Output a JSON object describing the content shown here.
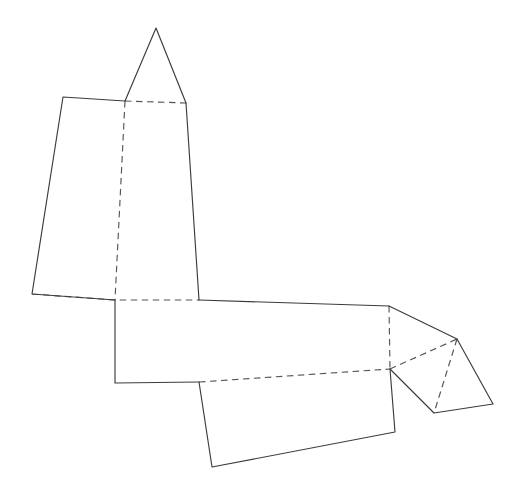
{
  "document": {
    "kind": "geometry-figure",
    "title": "Polyhedron net",
    "subject": "net-of-solid",
    "background_color": "#ffffff",
    "canvas": {
      "width": 525,
      "height": 498
    }
  },
  "style": {
    "solid_edge_color": "#3c3c40",
    "dashed_edge_color": "#55555a",
    "stroke_width": 1.15,
    "dash_pattern": "6.5 4.5"
  },
  "chart_data": {
    "type": "line",
    "xlabel": "",
    "ylabel": "",
    "xlim": [
      0,
      525
    ],
    "ylim": [
      498,
      0
    ],
    "grid": false,
    "legend": "none",
    "vertices": {
      "apex_top": [
        156,
        28
      ],
      "roof_base_left": [
        125,
        101
      ],
      "roof_base_right": [
        186,
        103
      ],
      "upper_left_top": [
        63,
        97
      ],
      "upper_left_bottom": [
        32,
        294
      ],
      "mid_left_top": [
        115,
        300
      ],
      "mid_left_bottom": [
        114,
        383
      ],
      "mid_right_top": [
        199,
        300
      ],
      "mid_right_bottom": [
        199,
        382
      ],
      "long_right_top": [
        389,
        306
      ],
      "long_right_bottom": [
        390,
        369
      ],
      "lower_panel_bottom_left": [
        212,
        467
      ],
      "lower_panel_bottom_right": [
        395,
        432
      ],
      "flap_apex_right": [
        457,
        339
      ],
      "flap_bottom_left": [
        434,
        413
      ],
      "flap_bottom_right": [
        493,
        404
      ]
    },
    "series": [
      {
        "name": "solid-edges",
        "style": "solid",
        "paths": [
          [
            [
              125,
              101
            ],
            [
              156,
              28
            ],
            [
              186,
              103
            ]
          ],
          [
            [
              125,
              101
            ],
            [
              63,
              97
            ],
            [
              32,
              294
            ],
            [
              115,
              300
            ]
          ],
          [
            [
              186,
              103
            ],
            [
              199,
              300
            ]
          ],
          [
            [
              115,
              300
            ],
            [
              115,
              383
            ],
            [
              199,
              382
            ]
          ],
          [
            [
              199,
              300
            ],
            [
              389,
              306
            ]
          ],
          [
            [
              389,
              306
            ],
            [
              457,
              339
            ]
          ],
          [
            [
              390,
              369
            ],
            [
              434,
              413
            ],
            [
              493,
              404
            ],
            [
              457,
              339
            ]
          ],
          [
            [
              390,
              369
            ],
            [
              395,
              432
            ],
            [
              212,
              467
            ],
            [
              199,
              382
            ]
          ]
        ]
      },
      {
        "name": "dashed-fold-lines",
        "style": "dashed",
        "paths": [
          [
            [
              125,
              101
            ],
            [
              186,
              103
            ]
          ],
          [
            [
              125,
              101
            ],
            [
              115,
              300
            ]
          ],
          [
            [
              32,
              294
            ],
            [
              115,
              300
            ],
            [
              199,
              300
            ]
          ],
          [
            [
              199,
              382
            ],
            [
              390,
              369
            ]
          ],
          [
            [
              389,
              306
            ],
            [
              390,
              369
            ]
          ],
          [
            [
              390,
              369
            ],
            [
              457,
              339
            ]
          ],
          [
            [
              457,
              339
            ],
            [
              434,
              413
            ]
          ]
        ]
      }
    ],
    "faces": [
      {
        "name": "roof-triangle",
        "points": [
          [
            125,
            101
          ],
          [
            156,
            28
          ],
          [
            186,
            103
          ]
        ]
      },
      {
        "name": "left-large-quad",
        "points": [
          [
            63,
            97
          ],
          [
            125,
            101
          ],
          [
            115,
            300
          ],
          [
            32,
            294
          ]
        ]
      },
      {
        "name": "right-upper-quad",
        "points": [
          [
            125,
            101
          ],
          [
            186,
            103
          ],
          [
            199,
            300
          ],
          [
            115,
            300
          ]
        ]
      },
      {
        "name": "center-square",
        "points": [
          [
            115,
            300
          ],
          [
            199,
            300
          ],
          [
            199,
            382
          ],
          [
            115,
            383
          ]
        ]
      },
      {
        "name": "long-horizontal-quad",
        "points": [
          [
            199,
            300
          ],
          [
            389,
            306
          ],
          [
            390,
            369
          ],
          [
            199,
            382
          ]
        ]
      },
      {
        "name": "lower-long-quad",
        "points": [
          [
            199,
            382
          ],
          [
            390,
            369
          ],
          [
            395,
            432
          ],
          [
            212,
            467
          ]
        ]
      },
      {
        "name": "flap-upper-triangle",
        "points": [
          [
            389,
            306
          ],
          [
            457,
            339
          ],
          [
            390,
            369
          ]
        ]
      },
      {
        "name": "flap-lower-triangle",
        "points": [
          [
            390,
            369
          ],
          [
            457,
            339
          ],
          [
            434,
            413
          ]
        ]
      },
      {
        "name": "flap-right-triangle",
        "points": [
          [
            457,
            339
          ],
          [
            493,
            404
          ],
          [
            434,
            413
          ]
        ]
      }
    ]
  }
}
